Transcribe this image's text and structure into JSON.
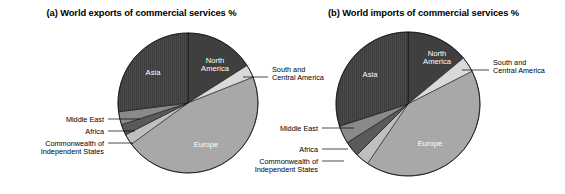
{
  "figure": {
    "background": "#ffffff",
    "width": 565,
    "height": 194
  },
  "panels": [
    {
      "id": "a",
      "title": "(a) World exports of commercial services %",
      "center": {
        "x": 188,
        "y": 103
      },
      "radius": 70,
      "inside_labels": [
        {
          "name": "asia",
          "text": "Asia",
          "x": 153,
          "y": 75,
          "color": "#ffffff"
        },
        {
          "name": "north-america",
          "text": "North",
          "x": 215,
          "y": 63,
          "color": "#ffffff"
        },
        {
          "name": "north-america-2",
          "text": "America",
          "x": 215,
          "y": 71,
          "color": "#ffffff"
        },
        {
          "name": "europe",
          "text": "Europe",
          "x": 206,
          "y": 147,
          "color": "#ffffff"
        }
      ],
      "callouts": [
        {
          "name": "south-and-central-america",
          "lines": [
            "South and",
            "Central America"
          ],
          "text_x": 272,
          "text_y": 72,
          "anchor": "start",
          "leader": "M 243,77 L 268,77"
        },
        {
          "name": "middle-east",
          "lines": [
            "Middle East"
          ],
          "text_x": 104,
          "text_y": 122,
          "anchor": "end",
          "leader": "M 108,119 L 140,119"
        },
        {
          "name": "africa",
          "lines": [
            "Africa"
          ],
          "text_x": 104,
          "text_y": 134,
          "anchor": "end",
          "leader": "M 108,131 L 135,131"
        },
        {
          "name": "commonwealth-of-independent-states",
          "lines": [
            "Commonwealth of",
            "Independent States"
          ],
          "text_x": 104,
          "text_y": 146,
          "anchor": "end",
          "leader": "M 108,143 L 133,143"
        }
      ]
    },
    {
      "id": "b",
      "title": "(b) World imports of commercial services %",
      "center": {
        "x": 126,
        "y": 104
      },
      "radius": 72,
      "inside_labels": [
        {
          "name": "asia",
          "text": "Asia",
          "x": 88,
          "y": 77,
          "color": "#ffffff"
        },
        {
          "name": "north-america",
          "text": "North",
          "x": 155,
          "y": 56,
          "color": "#ffffff"
        },
        {
          "name": "north-america-2",
          "text": "America",
          "x": 155,
          "y": 64,
          "color": "#ffffff"
        },
        {
          "name": "europe",
          "text": "Europe",
          "x": 148,
          "y": 146,
          "color": "#ffffff"
        }
      ],
      "callouts": [
        {
          "name": "south-and-central-america",
          "lines": [
            "South and",
            "Central America"
          ],
          "text_x": 211,
          "text_y": 65,
          "anchor": "start",
          "leader": "M 180,70 L 207,70"
        },
        {
          "name": "middle-east",
          "lines": [
            "Middle East"
          ],
          "text_x": 36,
          "text_y": 131,
          "anchor": "end",
          "leader": "M 40,128 L 72,128"
        },
        {
          "name": "africa",
          "lines": [
            "Africa"
          ],
          "text_x": 36,
          "text_y": 152,
          "anchor": "end",
          "leader": "M 40,149 L 66,149"
        },
        {
          "name": "commonwealth-of-independent-states",
          "lines": [
            "Commonwealth of",
            "Independent States"
          ],
          "text_x": 36,
          "text_y": 164,
          "anchor": "end",
          "leader": "M 40,161 L 62,161"
        }
      ]
    }
  ],
  "chart_data": [
    {
      "type": "pie",
      "title": "(a) World exports of commercial services %",
      "panel": "a",
      "start_angle_deg": 0,
      "direction": "clockwise",
      "legend_position": "callout-labels",
      "categories": [
        "North America",
        "South and Central America",
        "Europe",
        "Commonwealth of Independent States",
        "Africa",
        "Middle East",
        "Asia"
      ],
      "values": [
        16.0,
        3.0,
        46.0,
        2.5,
        2.5,
        3.0,
        27.0
      ],
      "colors": [
        "#3f3f3f",
        "#d9d9d9",
        "#a8a8a8",
        "#bfbfbf",
        "#5a5a5a",
        "#8a8a8a",
        "#4a4a4a"
      ],
      "hatch": [
        "none",
        "none",
        "none",
        "none",
        "none",
        "none",
        "vertical-lines"
      ]
    },
    {
      "type": "pie",
      "title": "(b) World imports of commercial services %",
      "panel": "b",
      "start_angle_deg": 0,
      "direction": "clockwise",
      "legend_position": "callout-labels",
      "categories": [
        "North America",
        "South and Central America",
        "Europe",
        "Commonwealth of Independent States",
        "Africa",
        "Middle East",
        "Asia"
      ],
      "values": [
        14.0,
        3.5,
        42.0,
        3.0,
        3.5,
        4.0,
        30.0
      ],
      "colors": [
        "#3f3f3f",
        "#d9d9d9",
        "#a8a8a8",
        "#bfbfbf",
        "#5a5a5a",
        "#8a8a8a",
        "#4a4a4a"
      ],
      "hatch": [
        "none",
        "none",
        "none",
        "none",
        "none",
        "none",
        "vertical-lines"
      ]
    }
  ]
}
